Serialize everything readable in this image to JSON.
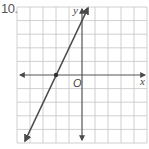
{
  "problem_number": "10.",
  "graph": {
    "x_axis_label": "x",
    "y_axis_label": "y",
    "origin_label": "O",
    "grid": {
      "x_range": [
        -5,
        5
      ],
      "y_range": [
        -5,
        5
      ],
      "step": 1
    },
    "line": {
      "equation": "y = 2x + 4",
      "slope": 2,
      "y_intercept": 4,
      "x_intercept": -2,
      "marked_point": [
        -2,
        0
      ]
    },
    "colors": {
      "grid": "#bdbdbd",
      "axes": "#555555",
      "line": "#4a4a4a"
    }
  }
}
